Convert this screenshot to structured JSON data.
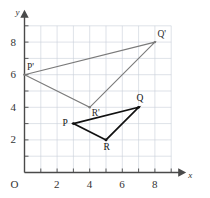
{
  "figure": {
    "background_color": "#ffffff",
    "grid_color": "#c8cfd8",
    "axis_color": "#4a4a4a",
    "preimage_color": "#111111",
    "image_color": "#7a7a7a"
  },
  "axes": {
    "x_name": "x",
    "y_name": "y",
    "origin_label": "O",
    "x_ticks": [
      {
        "value": 2,
        "label": "2"
      },
      {
        "value": 4,
        "label": "4"
      },
      {
        "value": 6,
        "label": "6"
      },
      {
        "value": 8,
        "label": "8"
      }
    ],
    "y_ticks": [
      {
        "value": 2,
        "label": "2"
      },
      {
        "value": 4,
        "label": "4"
      },
      {
        "value": 6,
        "label": "6"
      },
      {
        "value": 8,
        "label": "8"
      }
    ],
    "x_range": [
      0,
      9
    ],
    "y_range": [
      0,
      9
    ],
    "grid": true,
    "grid_step": 1
  },
  "chart_data": {
    "type": "scatter",
    "title": "",
    "xlabel": "x",
    "ylabel": "y",
    "xlim": [
      0,
      9
    ],
    "ylim": [
      0,
      9
    ],
    "grid": true,
    "legend": "none",
    "series": [
      {
        "name": "Triangle PQR",
        "role": "preimage",
        "color": "#111111",
        "closed": true,
        "points": [
          {
            "label": "P",
            "x": 3,
            "y": 3,
            "label_pos": "left"
          },
          {
            "label": "Q",
            "x": 7,
            "y": 4,
            "label_pos": "above"
          },
          {
            "label": "R",
            "x": 5,
            "y": 2,
            "label_pos": "below"
          }
        ]
      },
      {
        "name": "Triangle P'Q'R'",
        "role": "image",
        "color": "#7a7a7a",
        "closed": true,
        "points": [
          {
            "label": "P'",
            "x": 0,
            "y": 6,
            "label_pos": "above-right"
          },
          {
            "label": "Q'",
            "x": 8,
            "y": 8,
            "label_pos": "above-right"
          },
          {
            "label": "R'",
            "x": 4,
            "y": 4,
            "label_pos": "below-right"
          }
        ]
      }
    ]
  },
  "labels": {
    "P": "P",
    "Q": "Q",
    "R": "R",
    "P_img": "P'",
    "Q_img": "Q'",
    "R_img": "R'"
  }
}
